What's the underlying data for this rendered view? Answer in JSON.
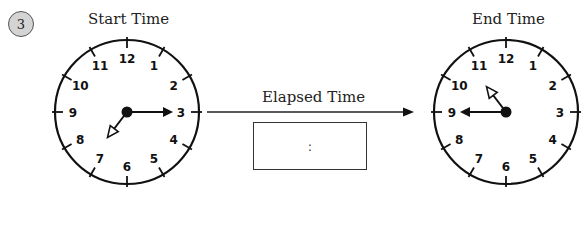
{
  "problem": {
    "number": "3"
  },
  "start_clock": {
    "title": "Start Time",
    "time": "7:15",
    "hour": 7,
    "minute": 15,
    "numerals": [
      "12",
      "1",
      "2",
      "3",
      "4",
      "5",
      "6",
      "7",
      "8",
      "9",
      "10",
      "11"
    ]
  },
  "end_clock": {
    "title": "End Time",
    "time": "10:45",
    "hour": 10,
    "minute": 45,
    "numerals": [
      "12",
      "1",
      "2",
      "3",
      "4",
      "5",
      "6",
      "7",
      "8",
      "9",
      "10",
      "11"
    ]
  },
  "elapsed": {
    "label": "Elapsed Time",
    "answer_placeholder": ":"
  },
  "colors": {
    "ink": "#111111",
    "badge_fill": "#d4d4d4"
  }
}
